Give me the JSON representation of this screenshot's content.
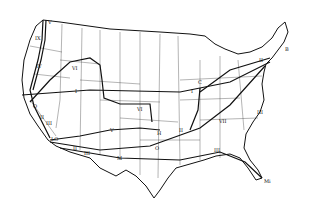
{
  "map": {
    "type": "route-map",
    "region": "United States (contiguous)",
    "colors": {
      "background": "#ffffff",
      "ink": "#111111",
      "borders": "#333333"
    },
    "route_labels": [
      {
        "id": "I-west",
        "text": "I",
        "x": 75,
        "y": 89
      },
      {
        "id": "I-east",
        "text": "I",
        "x": 191,
        "y": 89
      },
      {
        "id": "II-north",
        "text": "II",
        "x": 259,
        "y": 58
      },
      {
        "id": "II-mid",
        "text": "II",
        "x": 179,
        "y": 128
      },
      {
        "id": "II-sw",
        "text": "II",
        "x": 40,
        "y": 115
      },
      {
        "id": "II-south",
        "text": "II",
        "x": 73,
        "y": 146
      },
      {
        "id": "III-sw",
        "text": "III",
        "x": 46,
        "y": 121
      },
      {
        "id": "III-south",
        "text": "III",
        "x": 84,
        "y": 151
      },
      {
        "id": "III-gulf",
        "text": "III",
        "x": 214,
        "y": 148
      },
      {
        "id": "III-east",
        "text": "III",
        "x": 257,
        "y": 110
      },
      {
        "id": "IV",
        "text": "IV",
        "x": 36,
        "y": 64
      },
      {
        "id": "V-nw",
        "text": "V",
        "x": 48,
        "y": 20
      },
      {
        "id": "V-sw",
        "text": "V",
        "x": 110,
        "y": 128
      },
      {
        "id": "VI-nw",
        "text": "VI",
        "x": 72,
        "y": 66
      },
      {
        "id": "VI-mid",
        "text": "VI",
        "x": 137,
        "y": 107
      },
      {
        "id": "VII",
        "text": "VII",
        "x": 219,
        "y": 119
      },
      {
        "id": "IX",
        "text": "IX",
        "x": 35,
        "y": 36
      },
      {
        "id": "B",
        "text": "B",
        "x": 285,
        "y": 47
      },
      {
        "id": "C",
        "text": "C",
        "x": 198,
        "y": 80
      },
      {
        "id": "O-west",
        "text": "O",
        "x": 33,
        "y": 104
      },
      {
        "id": "O-mid",
        "text": "O",
        "x": 155,
        "y": 146
      },
      {
        "id": "H",
        "text": "H",
        "x": 157,
        "y": 131
      },
      {
        "id": "LO",
        "text": "LO",
        "x": 51,
        "y": 137
      },
      {
        "id": "M",
        "text": "M",
        "x": 117,
        "y": 156
      },
      {
        "id": "Mi",
        "text": "Mi",
        "x": 264,
        "y": 179
      }
    ]
  }
}
